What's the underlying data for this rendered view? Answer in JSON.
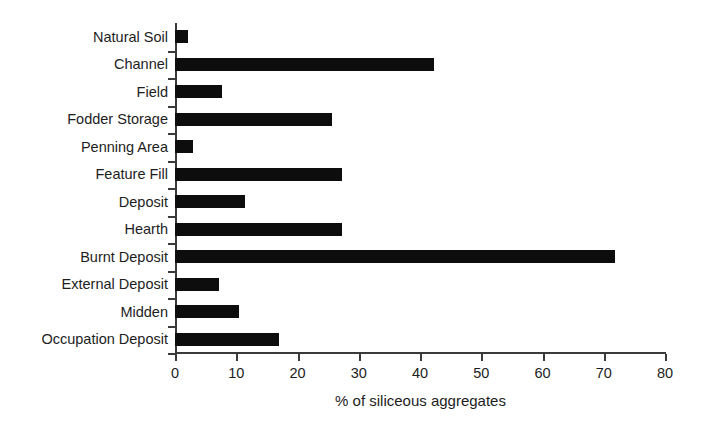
{
  "chart_data": {
    "type": "bar",
    "orientation": "horizontal",
    "title": "",
    "xlabel": "% of siliceous aggregates",
    "ylabel": "",
    "xlim": [
      0,
      80
    ],
    "xticks": [
      0,
      10,
      20,
      30,
      40,
      50,
      60,
      70,
      80
    ],
    "xticklabels": [
      "0",
      "10",
      "20",
      "30",
      "40",
      "50",
      "60",
      "70",
      "80"
    ],
    "grid": false,
    "legend": false,
    "bar_color": "#0d0d0d",
    "axis_color": "#3a3a3a",
    "background": "#ffffff",
    "categories": [
      "Natural Soil",
      "Channel",
      "Field",
      "Fodder Storage",
      "Penning Area",
      "Feature Fill",
      "Deposit",
      "Hearth",
      "Burnt Deposit",
      "External Deposit",
      "Midden",
      "Occupation Deposit"
    ],
    "values": [
      2.1,
      42.3,
      7.6,
      25.6,
      3.0,
      27.3,
      11.5,
      27.2,
      71.8,
      7.2,
      10.5,
      17.0
    ]
  }
}
